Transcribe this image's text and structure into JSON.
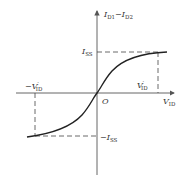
{
  "diagram": {
    "y_axis_label": {
      "main": "I",
      "sub1": "D1",
      "mid": "−I",
      "sub2": "D2"
    },
    "x_axis_label": {
      "main": "V",
      "sub": "ID"
    },
    "origin_label": "O",
    "iss_pos_label": {
      "main": "I",
      "sub": "SS"
    },
    "iss_neg_label": {
      "prefix": "−I",
      "sub": "SS"
    },
    "vid_pos_label": {
      "main": "V",
      "prime": "′",
      "sub": "ID"
    },
    "vid_neg_label": {
      "main": "−V",
      "prime": "′",
      "sub": "ID"
    },
    "colors": {
      "axis": "#555555",
      "curve": "#222222",
      "dashed": "#444444"
    }
  }
}
